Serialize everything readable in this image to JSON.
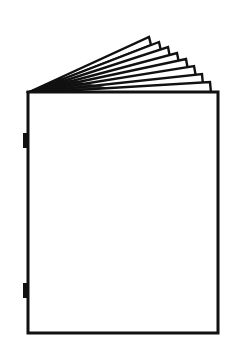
{
  "image": {
    "subject": "booklet-icon",
    "alt": "Line drawing of a stapled booklet with pages fanned open at the top",
    "colors": {
      "stroke": "#111111",
      "fill": "#ffffff",
      "background": "#ffffff"
    },
    "page_count_fanned": 8,
    "staple_count": 2
  }
}
